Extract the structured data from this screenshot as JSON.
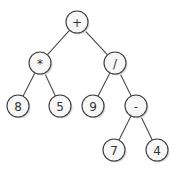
{
  "diagram": {
    "type": "expression-tree",
    "node_radius": 11,
    "nodes": [
      {
        "id": "n0",
        "label": "+",
        "x": 77,
        "y": 22
      },
      {
        "id": "n1",
        "label": "*",
        "x": 40,
        "y": 63
      },
      {
        "id": "n2",
        "label": "/",
        "x": 115,
        "y": 63
      },
      {
        "id": "n3",
        "label": "8",
        "x": 18,
        "y": 106
      },
      {
        "id": "n4",
        "label": "5",
        "x": 60,
        "y": 106
      },
      {
        "id": "n5",
        "label": "9",
        "x": 93,
        "y": 106
      },
      {
        "id": "n6",
        "label": "-",
        "x": 136,
        "y": 106
      },
      {
        "id": "n7",
        "label": "7",
        "x": 114,
        "y": 150
      },
      {
        "id": "n8",
        "label": "4",
        "x": 157,
        "y": 150
      }
    ],
    "edges": [
      {
        "from": "n0",
        "to": "n1"
      },
      {
        "from": "n0",
        "to": "n2"
      },
      {
        "from": "n1",
        "to": "n3"
      },
      {
        "from": "n1",
        "to": "n4"
      },
      {
        "from": "n2",
        "to": "n5"
      },
      {
        "from": "n2",
        "to": "n6"
      },
      {
        "from": "n6",
        "to": "n7"
      },
      {
        "from": "n6",
        "to": "n8"
      }
    ]
  }
}
